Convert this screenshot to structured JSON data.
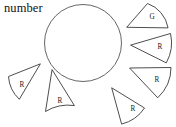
{
  "figure": {
    "caption": "number",
    "background_color": "#ffffff",
    "stroke_color": "#3a3a3a",
    "circle": {
      "name": "central-circle",
      "cx": 83,
      "cy": 43,
      "r": 38.5
    },
    "wedges": [
      {
        "id": "wedge-g-top-right",
        "label": "G",
        "apex_x": 127,
        "apex_y": 27,
        "label_x": 152,
        "label_y": 16,
        "path": "M127,27 L147.5,3.5 A31,31 0 0 1 168,27.5 Z"
      },
      {
        "id": "wedge-r-right-upper",
        "label": "R",
        "apex_x": 131,
        "apex_y": 45,
        "label_x": 160,
        "label_y": 46,
        "path": "M131,45 L170.5,33.5 A41,41 0 0 1 166.5,62.5 Z"
      },
      {
        "id": "wedge-r-right-lower",
        "label": "R",
        "apex_x": 130,
        "apex_y": 68,
        "label_x": 157,
        "label_y": 79,
        "path": "M130,68 L171,67.5 A41,41 0 0 1 158,97.5 Z"
      },
      {
        "id": "wedge-r-bottom-right",
        "label": "R",
        "apex_x": 112,
        "apex_y": 88,
        "label_x": 133,
        "label_y": 108,
        "path": "M112,88 L144.5,108 A38,38 0 0 1 122,124 Z"
      },
      {
        "id": "wedge-r-bottom-center",
        "label": "R",
        "apex_x": 52,
        "apex_y": 70,
        "label_x": 60,
        "label_y": 100,
        "path": "M52,70 L45.5,111.5 A43,43 0 0 1 74,105.5 Z"
      },
      {
        "id": "wedge-r-left",
        "label": "R",
        "apex_x": 40,
        "apex_y": 64,
        "label_x": 22,
        "label_y": 84,
        "path": "M40,64 L8.5,76.5 A34,34 0 0 0 19,99 Z"
      }
    ]
  }
}
